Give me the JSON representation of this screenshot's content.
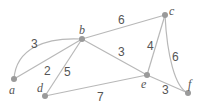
{
  "graph": {
    "nodes": [
      {
        "id": "a",
        "label": "a",
        "x": 14,
        "y": 79,
        "lx": 9,
        "ly": 94
      },
      {
        "id": "b",
        "label": "b",
        "x": 82,
        "y": 39,
        "lx": 79,
        "ly": 34
      },
      {
        "id": "c",
        "label": "c",
        "x": 165,
        "y": 15,
        "lx": 169,
        "ly": 15
      },
      {
        "id": "d",
        "label": "d",
        "x": 45,
        "y": 96,
        "lx": 37,
        "ly": 92
      },
      {
        "id": "e",
        "label": "e",
        "x": 147,
        "y": 75,
        "lx": 141,
        "ly": 88
      },
      {
        "id": "f",
        "label": "f",
        "x": 188,
        "y": 93,
        "lx": 188,
        "ly": 88
      }
    ],
    "edges": [
      {
        "from": "a",
        "to": "b",
        "weight": "3",
        "curved": true,
        "lx": 31,
        "ly": 48
      },
      {
        "from": "a",
        "to": "b",
        "weight": "2",
        "curved": false,
        "lx": 44,
        "ly": 75
      },
      {
        "from": "b",
        "to": "d",
        "weight": "5",
        "curved": false,
        "lx": 64,
        "ly": 76
      },
      {
        "from": "b",
        "to": "c",
        "weight": "6",
        "curved": false,
        "lx": 118,
        "ly": 24
      },
      {
        "from": "b",
        "to": "e",
        "weight": "3",
        "curved": false,
        "lx": 118,
        "ly": 56
      },
      {
        "from": "d",
        "to": "e",
        "weight": "7",
        "curved": false,
        "lx": 97,
        "ly": 101
      },
      {
        "from": "c",
        "to": "e",
        "weight": "4",
        "curved": false,
        "lx": 147,
        "ly": 50
      },
      {
        "from": "c",
        "to": "f",
        "weight": "6",
        "curved": true,
        "lx": 172,
        "ly": 61
      },
      {
        "from": "e",
        "to": "f",
        "weight": "3",
        "curved": false,
        "lx": 162,
        "ly": 94
      }
    ]
  },
  "colors": {
    "edge": "#b8b8b8",
    "node": "#9a9a9a",
    "text": "#555555"
  }
}
